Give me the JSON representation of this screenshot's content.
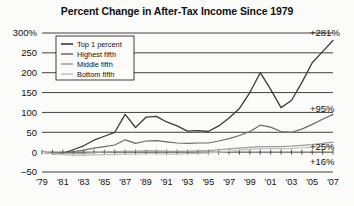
{
  "chart_data": {
    "type": "line",
    "title": "Percent Change in After-Tax Income Since 1979",
    "xlabel": "",
    "ylabel": "",
    "ylim": [
      -50,
      300
    ],
    "xlim": [
      1979,
      2007
    ],
    "grid": true,
    "legend_position": "top-left",
    "ytick_labels": [
      "300%",
      "250",
      "200",
      "150",
      "100",
      "50",
      "0",
      "–50"
    ],
    "ytick_values": [
      300,
      250,
      200,
      150,
      100,
      50,
      0,
      -50
    ],
    "xtick_labels": [
      "'79",
      "'81",
      "'83",
      "'85",
      "'87",
      "'89",
      "'91",
      "'93",
      "'95",
      "'97",
      "'99",
      "'01",
      "'03",
      "'05",
      "'07"
    ],
    "xtick_values": [
      1979,
      1981,
      1983,
      1985,
      1987,
      1989,
      1991,
      1993,
      1995,
      1997,
      1999,
      2001,
      2003,
      2005,
      2007
    ],
    "x": [
      1979,
      1980,
      1981,
      1982,
      1983,
      1984,
      1985,
      1986,
      1987,
      1988,
      1989,
      1990,
      1991,
      1992,
      1993,
      1994,
      1995,
      1996,
      1997,
      1998,
      1999,
      2000,
      2001,
      2002,
      2003,
      2004,
      2005,
      2006,
      2007
    ],
    "series": [
      {
        "name": "Top 1 percent",
        "color": "#3a3a3a",
        "width": 1.3,
        "end_label": "+281%",
        "values": [
          0,
          -4,
          -3,
          6,
          16,
          30,
          40,
          50,
          95,
          62,
          88,
          90,
          76,
          66,
          53,
          54,
          52,
          66,
          86,
          110,
          150,
          200,
          158,
          112,
          130,
          175,
          225,
          253,
          281
        ]
      },
      {
        "name": "Highest fifth",
        "color": "#6a6a6a",
        "width": 1.2,
        "end_label": "+95%",
        "values": [
          0,
          -3,
          -2,
          1,
          5,
          10,
          14,
          18,
          31,
          22,
          28,
          29,
          26,
          23,
          22,
          23,
          23,
          28,
          34,
          42,
          52,
          68,
          63,
          52,
          50,
          58,
          70,
          83,
          95
        ]
      },
      {
        "name": "Middle fifth",
        "color": "#9a9a9a",
        "width": 1.2,
        "end_label": "+25%",
        "values": [
          0,
          -3,
          -4,
          -4,
          -3,
          -1,
          0,
          1,
          2,
          2,
          3,
          3,
          2,
          2,
          2,
          3,
          4,
          6,
          8,
          10,
          12,
          14,
          14,
          14,
          15,
          17,
          19,
          22,
          25
        ]
      },
      {
        "name": "Bottom fifth",
        "color": "#bfbfbf",
        "width": 1.2,
        "end_label": "+16%",
        "values": [
          0,
          -4,
          -6,
          -8,
          -8,
          -7,
          -6,
          -6,
          -5,
          -5,
          -4,
          -4,
          -5,
          -5,
          -4,
          -3,
          -2,
          0,
          2,
          5,
          7,
          9,
          9,
          9,
          9,
          11,
          12,
          14,
          16
        ]
      }
    ],
    "annotations": [
      {
        "text": "+281%",
        "value": 281,
        "series": "Top 1 percent"
      },
      {
        "text": "+95%",
        "value": 95,
        "series": "Highest fifth"
      },
      {
        "text": "+25%",
        "value": 25,
        "series": "Middle fifth"
      },
      {
        "text": "+16%",
        "value": 16,
        "series": "Bottom fifth"
      }
    ]
  }
}
